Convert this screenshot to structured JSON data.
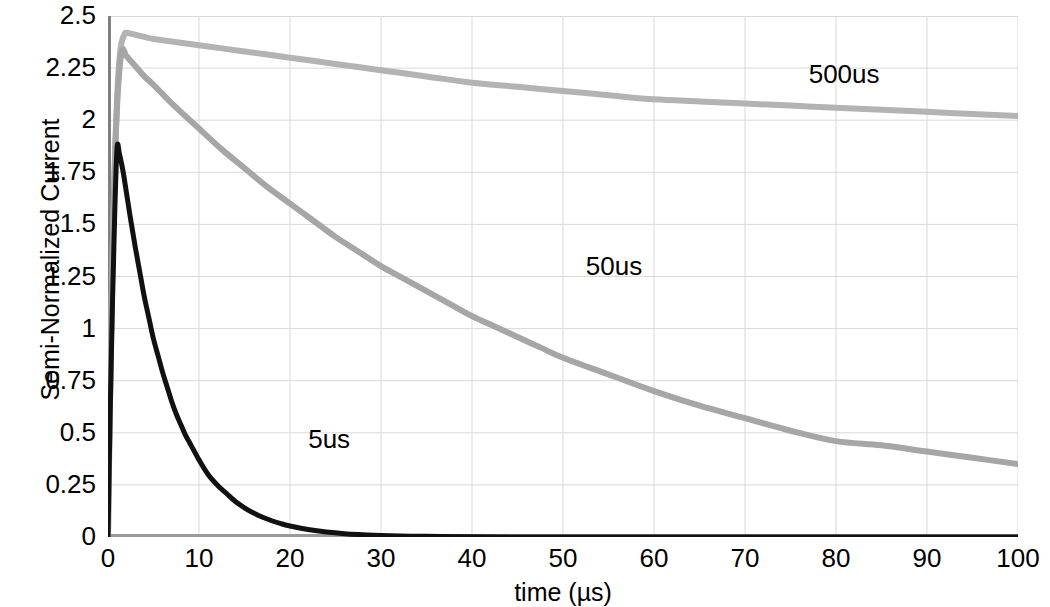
{
  "chart_data": {
    "type": "line",
    "title": "",
    "xlabel": "time (µs)",
    "ylabel": "Semi-Normalized Current",
    "xlim": [
      0,
      100
    ],
    "ylim": [
      0,
      2.5
    ],
    "xticks": [
      0,
      10,
      20,
      30,
      40,
      50,
      60,
      70,
      80,
      90,
      100
    ],
    "xtick_labels": [
      "0",
      "10",
      "20",
      "30",
      "40",
      "50",
      "60",
      "70",
      "80",
      "90",
      "100"
    ],
    "yticks": [
      0,
      0.25,
      0.5,
      0.75,
      1,
      1.25,
      1.5,
      1.75,
      2,
      2.25,
      2.5
    ],
    "ytick_labels": [
      "0",
      "0.25",
      "0.5",
      "0.75",
      "1",
      "1.25",
      "1.5",
      "1.75",
      "2",
      "2.25",
      "2.5"
    ],
    "grid": true,
    "grid_color": "#d9d9d9",
    "legend": "inline-annotations",
    "annotations": [
      {
        "text": "500us",
        "x": 77.0,
        "y": 2.22
      },
      {
        "text": "50us",
        "x": 52.5,
        "y": 1.3
      },
      {
        "text": "5us",
        "x": 22.0,
        "y": 0.47
      }
    ],
    "series": [
      {
        "name": "5us",
        "color": "#111111",
        "width": 5,
        "peak_x": 1.0,
        "peak_y": 1.87,
        "points": [
          [
            0,
            0
          ],
          [
            0.25,
            0.62
          ],
          [
            0.5,
            1.14
          ],
          [
            0.75,
            1.57
          ],
          [
            1,
            1.87
          ],
          [
            1.25,
            1.84
          ],
          [
            1.5,
            1.79
          ],
          [
            1.75,
            1.73
          ],
          [
            2,
            1.66
          ],
          [
            2.5,
            1.52
          ],
          [
            3,
            1.39
          ],
          [
            3.5,
            1.27
          ],
          [
            4,
            1.15
          ],
          [
            4.5,
            1.05
          ],
          [
            5,
            0.95
          ],
          [
            5.5,
            0.87
          ],
          [
            6,
            0.79
          ],
          [
            6.5,
            0.72
          ],
          [
            7,
            0.65
          ],
          [
            7.5,
            0.59
          ],
          [
            8,
            0.54
          ],
          [
            8.5,
            0.49
          ],
          [
            9,
            0.45
          ],
          [
            9.5,
            0.41
          ],
          [
            10,
            0.37
          ],
          [
            11,
            0.3
          ],
          [
            12,
            0.25
          ],
          [
            13,
            0.21
          ],
          [
            14,
            0.17
          ],
          [
            15,
            0.14
          ],
          [
            16,
            0.115
          ],
          [
            17,
            0.095
          ],
          [
            18,
            0.078
          ],
          [
            19,
            0.064
          ],
          [
            20,
            0.053
          ],
          [
            22,
            0.036
          ],
          [
            24,
            0.024
          ],
          [
            26,
            0.016
          ],
          [
            28,
            0.011
          ],
          [
            30,
            0.007
          ],
          [
            35,
            0.003
          ],
          [
            40,
            0.001
          ],
          [
            50,
            0.0
          ],
          [
            60,
            0
          ],
          [
            70,
            0
          ],
          [
            80,
            0
          ],
          [
            90,
            0
          ],
          [
            100,
            0
          ]
        ]
      },
      {
        "name": "50us",
        "color": "#a6a6a6",
        "width": 6,
        "peak_x": 1.6,
        "peak_y": 2.34,
        "points": [
          [
            0,
            0
          ],
          [
            0.2,
            0.62
          ],
          [
            0.4,
            1.14
          ],
          [
            0.6,
            1.55
          ],
          [
            0.8,
            1.86
          ],
          [
            1.0,
            2.07
          ],
          [
            1.2,
            2.21
          ],
          [
            1.4,
            2.3
          ],
          [
            1.6,
            2.34
          ],
          [
            1.8,
            2.33
          ],
          [
            2,
            2.31
          ],
          [
            3,
            2.26
          ],
          [
            4,
            2.21
          ],
          [
            5,
            2.17
          ],
          [
            7.5,
            2.06
          ],
          [
            10,
            1.96
          ],
          [
            12.5,
            1.86
          ],
          [
            15,
            1.77
          ],
          [
            17.5,
            1.68
          ],
          [
            20,
            1.6
          ],
          [
            22.5,
            1.52
          ],
          [
            25,
            1.44
          ],
          [
            27.5,
            1.37
          ],
          [
            30,
            1.3
          ],
          [
            32.5,
            1.24
          ],
          [
            35,
            1.18
          ],
          [
            37.5,
            1.12
          ],
          [
            40,
            1.06
          ],
          [
            42.5,
            1.01
          ],
          [
            45,
            0.96
          ],
          [
            47.5,
            0.91
          ],
          [
            50,
            0.86
          ],
          [
            55,
            0.78
          ],
          [
            60,
            0.7
          ],
          [
            65,
            0.63
          ],
          [
            70,
            0.57
          ],
          [
            75,
            0.51
          ],
          [
            80,
            0.46
          ],
          [
            85,
            0.44
          ],
          [
            90,
            0.41
          ],
          [
            95,
            0.38
          ],
          [
            100,
            0.35
          ]
        ]
      },
      {
        "name": "500us",
        "color": "#b3b3b3",
        "width": 6,
        "peak_x": 2.0,
        "peak_y": 2.42,
        "points": [
          [
            0,
            0
          ],
          [
            0.2,
            0.6
          ],
          [
            0.4,
            1.12
          ],
          [
            0.6,
            1.55
          ],
          [
            0.8,
            1.88
          ],
          [
            1.0,
            2.11
          ],
          [
            1.2,
            2.26
          ],
          [
            1.4,
            2.35
          ],
          [
            1.6,
            2.39
          ],
          [
            1.8,
            2.41
          ],
          [
            2.0,
            2.42
          ],
          [
            3,
            2.41
          ],
          [
            4,
            2.4
          ],
          [
            5,
            2.39
          ],
          [
            10,
            2.36
          ],
          [
            15,
            2.33
          ],
          [
            20,
            2.3
          ],
          [
            25,
            2.27
          ],
          [
            30,
            2.24
          ],
          [
            35,
            2.21
          ],
          [
            40,
            2.18
          ],
          [
            45,
            2.16
          ],
          [
            50,
            2.14
          ],
          [
            55,
            2.12
          ],
          [
            60,
            2.1
          ],
          [
            65,
            2.09
          ],
          [
            70,
            2.08
          ],
          [
            75,
            2.07
          ],
          [
            80,
            2.06
          ],
          [
            85,
            2.05
          ],
          [
            90,
            2.04
          ],
          [
            95,
            2.03
          ],
          [
            100,
            2.02
          ]
        ]
      }
    ]
  }
}
